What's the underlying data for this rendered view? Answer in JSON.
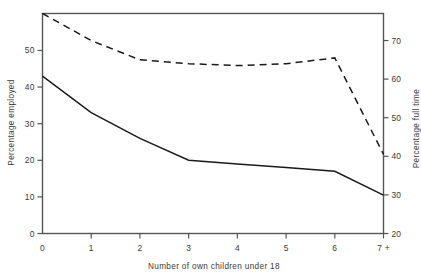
{
  "chart_data": {
    "type": "line",
    "title": "",
    "xlabel": "Number of own children under 18",
    "categories": [
      "0",
      "1",
      "2",
      "3",
      "4",
      "5",
      "6",
      "7 +"
    ],
    "x": [
      0,
      1,
      2,
      3,
      4,
      5,
      6,
      7
    ],
    "grid": false,
    "legend": "none",
    "axes": {
      "left": {
        "label": "Percentage employed",
        "ticks": [
          "0",
          "10",
          "20",
          "30",
          "40",
          "50"
        ],
        "tick_values": [
          0,
          10,
          20,
          30,
          40,
          50
        ],
        "ylim": [
          0,
          60.1
        ]
      },
      "right": {
        "label": "Percentage full time",
        "ticks": [
          "20",
          "30",
          "40",
          "50",
          "60",
          "70"
        ],
        "tick_values": [
          20,
          30,
          40,
          50,
          60,
          70
        ],
        "ylim": [
          20,
          77.0
        ]
      }
    },
    "series": [
      {
        "name": "Percentage employed",
        "axis": "left",
        "style": "solid",
        "color": "#1a1a1a",
        "values": [
          43.0,
          33.0,
          26.0,
          20.0,
          19.0,
          18.0,
          17.0,
          10.5
        ]
      },
      {
        "name": "Percentage full time",
        "axis": "right",
        "style": "dashed",
        "color": "#1a1a1a",
        "values": [
          77.0,
          70.0,
          65.0,
          64.0,
          63.5,
          64.0,
          65.5,
          40.5
        ]
      }
    ]
  },
  "figure": {
    "frame_color": "#555555",
    "background": "#ffffff"
  }
}
